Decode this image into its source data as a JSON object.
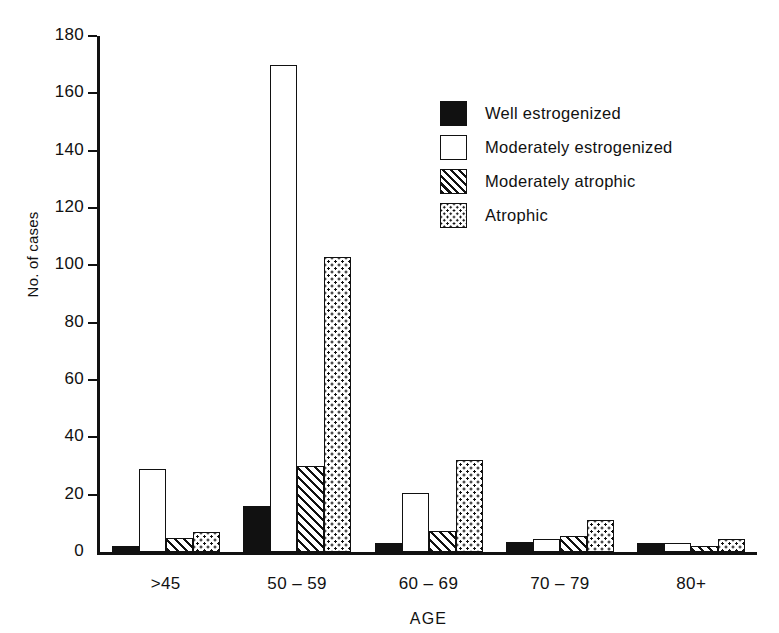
{
  "chart_data": {
    "type": "bar",
    "title": "",
    "xlabel": "AGE",
    "ylabel": "No. of cases",
    "ylim": [
      0,
      180
    ],
    "yticks": [
      0,
      20,
      40,
      60,
      80,
      100,
      120,
      140,
      160,
      180
    ],
    "grid": false,
    "legend_position": "upper right",
    "categories": [
      ">45",
      "50 – 59",
      "60 – 69",
      "70 – 79",
      "80+"
    ],
    "series": [
      {
        "name": "Well estrogenized",
        "pattern": "solid",
        "values": [
          2,
          16,
          3,
          3.5,
          3
        ]
      },
      {
        "name": "Moderately estrogenized",
        "pattern": "open",
        "values": [
          29,
          170,
          20.5,
          4.5,
          3
        ]
      },
      {
        "name": "Moderately atrophic",
        "pattern": "hatch",
        "values": [
          5,
          30,
          7.5,
          5.5,
          2
        ]
      },
      {
        "name": "Atrophic",
        "pattern": "dots",
        "values": [
          7,
          103,
          32,
          11,
          4.5
        ]
      }
    ]
  },
  "axes": {
    "y_title": "No. of cases",
    "x_title": "AGE",
    "y_tick_labels": [
      "180",
      "160",
      "140",
      "120",
      "100",
      "80",
      "60",
      "40",
      "20",
      "0"
    ],
    "x_tick_labels": [
      ">45",
      "50 – 59",
      "60 – 69",
      "70 – 79",
      "80+"
    ]
  },
  "legend": {
    "items": [
      {
        "label": "Well estrogenized",
        "swatch": "solid"
      },
      {
        "label": "Moderately estrogenized",
        "swatch": "open"
      },
      {
        "label": "Moderately atrophic",
        "swatch": "hatch"
      },
      {
        "label": "Atrophic",
        "swatch": "dots"
      }
    ]
  },
  "colors": {
    "ink": "#111111",
    "background": "#ffffff"
  }
}
